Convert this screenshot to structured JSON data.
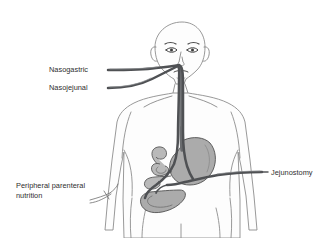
{
  "figure": {
    "kind": "medical-diagram",
    "background_color": "#ffffff",
    "outline_color": "#8d8d8d",
    "organ_color": "#ababab",
    "tube_color": "#4f5154",
    "label_color": "#2e2e2e"
  },
  "labels": {
    "nasogastric": "Nasogastric",
    "nasojejunal": "Nasojejunal",
    "peripheral_parenteral_line1": "Peripheral parenteral",
    "peripheral_parenteral_line2": "nutrition",
    "jejunostomy": "Jejunostomy"
  },
  "anatomy": {
    "head": "head-outline",
    "torso": "torso-outline",
    "stomach": "stomach",
    "small_bowel": "small-intestine-coils",
    "esophagus": "esophagus"
  },
  "devices": [
    {
      "name": "nasogastric-tube",
      "route": "nose to stomach"
    },
    {
      "name": "nasojejunal-tube",
      "route": "nose to jejunum"
    },
    {
      "name": "jejunostomy-tube",
      "route": "abdominal wall to jejunum"
    },
    {
      "name": "peripheral-cannula",
      "route": "peripheral vein in arm"
    }
  ]
}
